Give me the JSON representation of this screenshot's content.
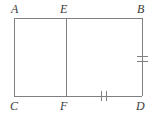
{
  "figure": {
    "kind": "geometry-diagram",
    "background_color": "#ffffff",
    "stroke_color": "#808080",
    "label_color": "#3a3a3a",
    "stroke_width": 1,
    "rectangle": {
      "name": "ABDC",
      "left": 14,
      "top": 18,
      "right": 142,
      "bottom": 96
    },
    "segments": [
      {
        "name": "AB",
        "x1": 14,
        "y1": 18,
        "x2": 142,
        "y2": 18
      },
      {
        "name": "CD",
        "x1": 14,
        "y1": 96,
        "x2": 142,
        "y2": 96
      },
      {
        "name": "AC",
        "x1": 14,
        "y1": 18,
        "x2": 14,
        "y2": 96
      },
      {
        "name": "BD",
        "x1": 142,
        "y1": 18,
        "x2": 142,
        "y2": 96
      },
      {
        "name": "EF",
        "x1": 66,
        "y1": 18,
        "x2": 66,
        "y2": 96
      }
    ],
    "labels": [
      {
        "id": "A",
        "text": "A",
        "x": 11,
        "y": 3
      },
      {
        "id": "E",
        "text": "E",
        "x": 60,
        "y": 3
      },
      {
        "id": "B",
        "text": "B",
        "x": 137,
        "y": 3
      },
      {
        "id": "C",
        "text": "C",
        "x": 10,
        "y": 100
      },
      {
        "id": "F",
        "text": "F",
        "x": 60,
        "y": 100
      },
      {
        "id": "D",
        "text": "D",
        "x": 136,
        "y": 100
      }
    ],
    "tick_marks": [
      {
        "id": "bd-tick-1",
        "on_segment": "BD",
        "orientation": "horizontal",
        "x1": 137,
        "y1": 56,
        "x2": 148,
        "y2": 56
      },
      {
        "id": "bd-tick-2",
        "on_segment": "BD",
        "orientation": "horizontal",
        "x1": 137,
        "y1": 61,
        "x2": 148,
        "y2": 61
      },
      {
        "id": "fd-tick-1",
        "on_segment": "FD",
        "orientation": "vertical",
        "x1": 101,
        "y1": 91,
        "x2": 101,
        "y2": 101
      },
      {
        "id": "fd-tick-2",
        "on_segment": "FD",
        "orientation": "vertical",
        "x1": 106,
        "y1": 91,
        "x2": 106,
        "y2": 101
      }
    ]
  }
}
